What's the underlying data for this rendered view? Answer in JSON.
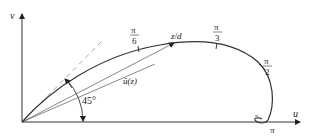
{
  "diagram": {
    "axes": {
      "x_label": "u",
      "y_label": "v"
    },
    "angle_label": "45°",
    "vector_label": "ū(z)",
    "point_label": "z/d",
    "ticks": [
      {
        "num": "π",
        "den": "6"
      },
      {
        "num": "π",
        "den": "3"
      },
      {
        "num": "π",
        "den": "2"
      }
    ],
    "end_label": "π",
    "small_label": "≈",
    "colors": {
      "curve": "#333333",
      "dashed": "#aaaaaa",
      "axis": "#333333"
    }
  }
}
